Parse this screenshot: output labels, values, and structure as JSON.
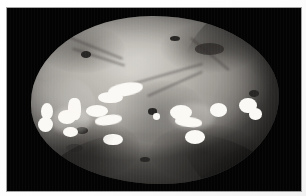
{
  "figure": {
    "kind": "grayscale-photograph",
    "alt_text": "Grayscale spacecraft image of an irregularly shaped moon against black space, with a band of bright patches across its middle",
    "frame_color": "#ffffff",
    "background_color": "#030303",
    "surface_color": "#b4b1ab",
    "highlight_color": "#f4f2ee",
    "shadow_color": "#2d2b29"
  },
  "image_region": {
    "plate_x": 7,
    "plate_y": 8,
    "plate_width": 294,
    "plate_height": 183
  },
  "body": {
    "center_x": 148,
    "center_y": 92,
    "width": 248,
    "height": 168,
    "terminator": "right-limb"
  },
  "bright_spots": [
    {
      "name": "spot-left-rim-upper",
      "x": 4,
      "y": 52,
      "w": 5,
      "h": 10,
      "soft": false
    },
    {
      "name": "spot-left-rim-lower",
      "x": 3,
      "y": 60,
      "w": 6,
      "h": 9,
      "soft": false
    },
    {
      "name": "spot-left-cluster-a",
      "x": 11,
      "y": 56,
      "w": 7,
      "h": 8,
      "soft": false
    },
    {
      "name": "spot-left-cluster-b",
      "x": 15,
      "y": 49,
      "w": 5,
      "h": 13,
      "soft": false
    },
    {
      "name": "spot-left-cluster-c",
      "x": 13,
      "y": 66,
      "w": 6,
      "h": 6,
      "soft": false
    },
    {
      "name": "spot-left-mid",
      "x": 22,
      "y": 53,
      "w": 9,
      "h": 7,
      "soft": false
    },
    {
      "name": "spot-midleft-streak",
      "x": 26,
      "y": 59,
      "w": 11,
      "h": 6,
      "soft": false
    },
    {
      "name": "spot-midleft-lower",
      "x": 29,
      "y": 70,
      "w": 8,
      "h": 7,
      "soft": false
    },
    {
      "name": "spot-upper-streak",
      "x": 31,
      "y": 40,
      "w": 14,
      "h": 8,
      "soft": false
    },
    {
      "name": "spot-upper-streak-b",
      "x": 27,
      "y": 45,
      "w": 10,
      "h": 7,
      "soft": false
    },
    {
      "name": "spot-center-dot",
      "x": 49,
      "y": 58,
      "w": 3,
      "h": 4,
      "soft": false
    },
    {
      "name": "spot-center-right",
      "x": 56,
      "y": 53,
      "w": 9,
      "h": 9,
      "soft": false
    },
    {
      "name": "spot-center-right-b",
      "x": 58,
      "y": 60,
      "w": 11,
      "h": 6,
      "soft": false
    },
    {
      "name": "spot-right-lower",
      "x": 62,
      "y": 68,
      "w": 8,
      "h": 8,
      "soft": false
    },
    {
      "name": "spot-right-cluster",
      "x": 72,
      "y": 52,
      "w": 7,
      "h": 8,
      "soft": false
    },
    {
      "name": "spot-right-rim",
      "x": 84,
      "y": 49,
      "w": 7,
      "h": 9,
      "soft": false
    },
    {
      "name": "spot-right-rim-b",
      "x": 88,
      "y": 55,
      "w": 5,
      "h": 7,
      "soft": false
    }
  ],
  "dark_features": [
    {
      "name": "crater-upper-left",
      "x": 20,
      "y": 21,
      "w": 4,
      "h": 4
    },
    {
      "name": "crater-upper-mid",
      "x": 56,
      "y": 12,
      "w": 4,
      "h": 3
    },
    {
      "name": "crater-upper-right",
      "x": 66,
      "y": 16,
      "w": 12,
      "h": 7
    },
    {
      "name": "crater-right-limb",
      "x": 88,
      "y": 44,
      "w": 4,
      "h": 4
    },
    {
      "name": "crater-center",
      "x": 47,
      "y": 55,
      "w": 4,
      "h": 4
    },
    {
      "name": "crater-left-lower",
      "x": 18,
      "y": 66,
      "w": 5,
      "h": 4
    },
    {
      "name": "crater-lower-mid",
      "x": 44,
      "y": 84,
      "w": 4,
      "h": 3
    },
    {
      "name": "crater-lower-left",
      "x": 14,
      "y": 76,
      "w": 7,
      "h": 5
    }
  ]
}
